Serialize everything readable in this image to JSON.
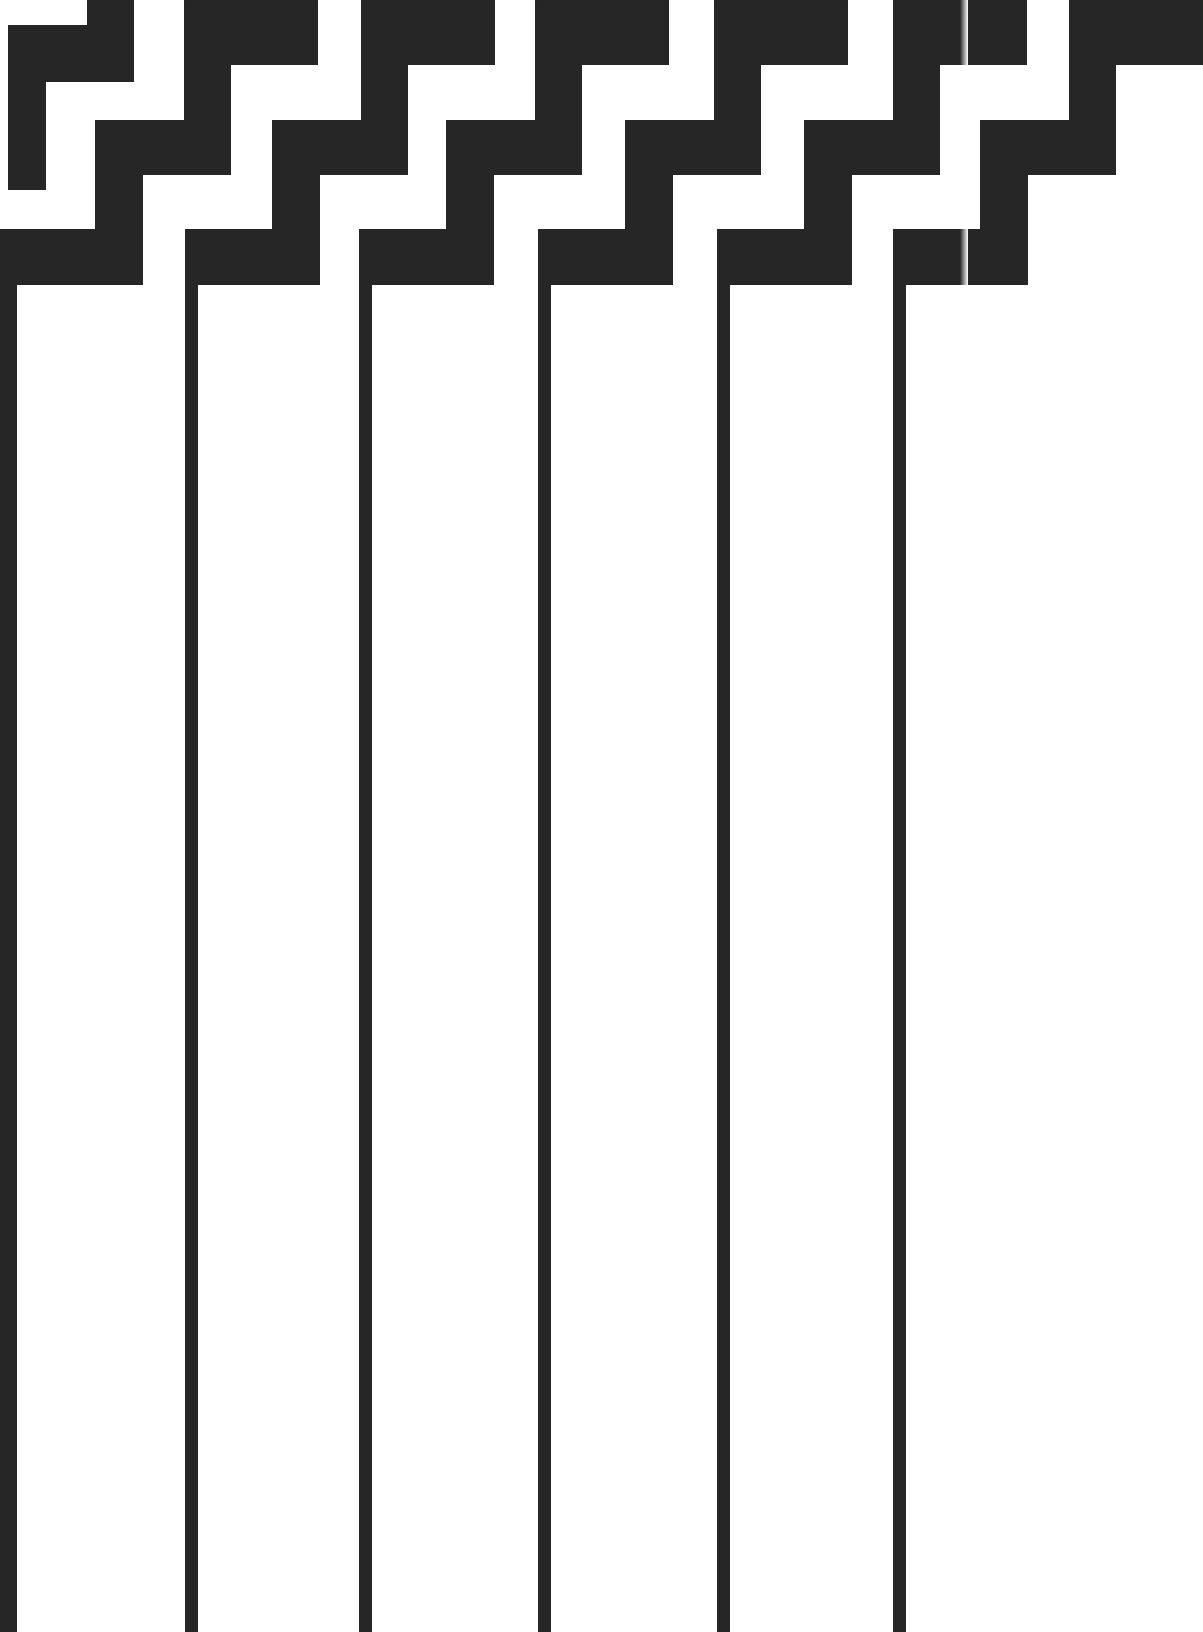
{
  "pattern": {
    "name": "stepped-zigzag-band-with-vertical-stripes",
    "colors": {
      "ink": "#262626",
      "background": "#ffffff"
    },
    "period_px": 178,
    "column_offsets": [
      8,
      185,
      359,
      538,
      717,
      893
    ],
    "unit_shape": [
      {
        "part": "bottom-bar",
        "x": 0,
        "y": 229,
        "w": 135,
        "h": 56
      },
      {
        "part": "lower-riser",
        "x": 87,
        "y": 120,
        "w": 48,
        "h": 165
      },
      {
        "part": "middle-bar",
        "x": 87,
        "y": 120,
        "w": 136,
        "h": 55
      },
      {
        "part": "upper-riser",
        "x": 176,
        "y": 12,
        "w": 47,
        "h": 163
      },
      {
        "part": "top-bar",
        "x": 176,
        "y": 0,
        "w": 134,
        "h": 65
      }
    ],
    "stripe": {
      "width": 13,
      "top": 285,
      "bottom": 1632
    },
    "leftmost_partial": [
      {
        "part": "top-nub",
        "x": 87,
        "y": 0,
        "w": 47,
        "h": 25
      },
      {
        "part": "top-bar",
        "x": 8,
        "y": 25,
        "w": 126,
        "h": 57
      },
      {
        "part": "riser",
        "x": 8,
        "y": 82,
        "w": 38,
        "h": 108
      }
    ],
    "left_stripe": {
      "x": 0,
      "width": 17
    }
  }
}
